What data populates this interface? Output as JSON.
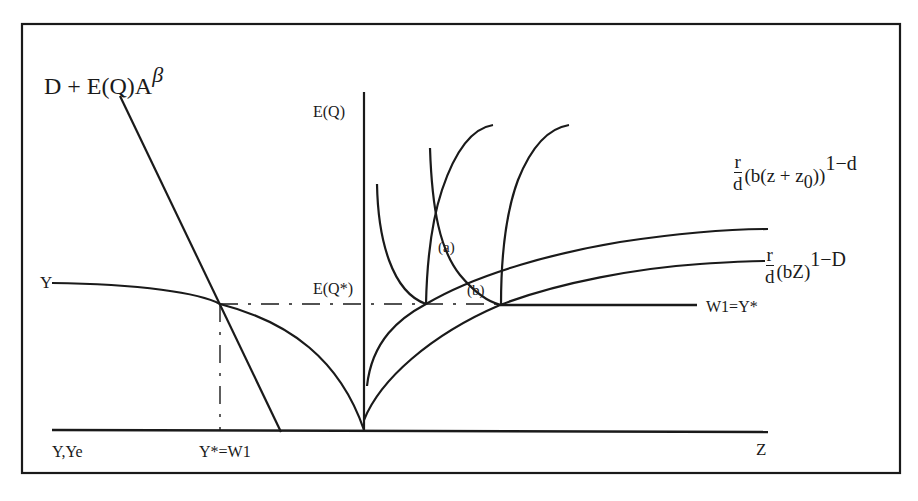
{
  "diagram": {
    "title_formula": {
      "base": "D + E(Q)A",
      "superscript": "β"
    },
    "axis_labels": {
      "vertical_axis": "E(Q)",
      "dashed_level": "E(Q*)",
      "left_curve_start": "Y",
      "bottom_left": "Y,Ye",
      "bottom_mid": "Y*=W1",
      "bottom_right": "Z",
      "flat_line": "W1=Y*"
    },
    "point_labels": {
      "a": "(a)",
      "b": "(b)"
    },
    "upper_curve_formula": {
      "num": "r",
      "den": "d",
      "body_prefix": "(b(z + z",
      "subscript": "0",
      "body_suffix": "))",
      "superscript": "1−d"
    },
    "lower_curve_formula": {
      "num": "r",
      "den": "d",
      "body": "(bZ)",
      "superscript": "1−D"
    },
    "colors": {
      "line": "#1a1a1a",
      "background": "#ffffff"
    }
  }
}
